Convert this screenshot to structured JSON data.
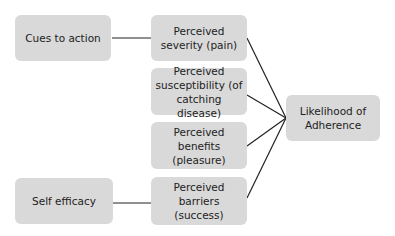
{
  "diagram": {
    "nodes": {
      "cues": "Cues to action",
      "self_efficacy": "Self efficacy",
      "severity": "Perceived severity (pain)",
      "susceptibility": "Perceived susceptibility (of catching disease)",
      "benefits": "Perceived benefits (pleasure)",
      "barriers": "Perceived barriers (success)",
      "outcome": "Likelihood of Adherence"
    },
    "edges": [
      [
        "cues",
        "severity"
      ],
      [
        "self_efficacy",
        "barriers"
      ],
      [
        "severity",
        "outcome"
      ],
      [
        "susceptibility",
        "outcome"
      ],
      [
        "benefits",
        "outcome"
      ],
      [
        "barriers",
        "outcome"
      ]
    ],
    "colors": {
      "box": "#d9d9d9",
      "line": "#222222",
      "text": "#222222"
    }
  }
}
